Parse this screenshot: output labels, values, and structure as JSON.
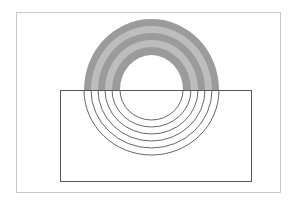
{
  "diagram": {
    "colors": {
      "background": "#ffffff",
      "frame": "#c9c9c9",
      "rect_stroke": "#555555",
      "arc_stroke": "#555555",
      "band_dark": "#9b9b9b",
      "band_light": "#bdbdbd"
    },
    "outer_frame": {
      "x": 16,
      "y": 12,
      "width": 264,
      "height": 180
    },
    "inner_rect": {
      "x": 60,
      "y": 90,
      "width": 191,
      "height": 91
    },
    "center": {
      "x": 151.5,
      "y": 90
    },
    "top_bands": [
      {
        "rx": 67.5,
        "ry": 71,
        "shade": "dark"
      },
      {
        "rx": 60.5,
        "ry": 64,
        "shade": "light"
      },
      {
        "rx": 53.5,
        "ry": 57,
        "shade": "dark"
      },
      {
        "rx": 46.5,
        "ry": 50,
        "shade": "light"
      },
      {
        "rx": 39.5,
        "ry": 43,
        "shade": "dark"
      },
      {
        "rx": 31.5,
        "ry": 35,
        "shade": "white"
      }
    ],
    "bottom_arcs": [
      {
        "rx": 31.5,
        "ry": 30
      },
      {
        "rx": 39.5,
        "ry": 37
      },
      {
        "rx": 46.5,
        "ry": 44
      },
      {
        "rx": 53.5,
        "ry": 51
      },
      {
        "rx": 60.5,
        "ry": 58
      },
      {
        "rx": 67.5,
        "ry": 65
      }
    ]
  }
}
